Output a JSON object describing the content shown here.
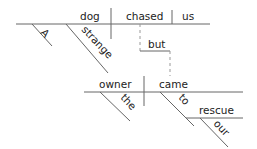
{
  "diagram": {
    "type": "sentence-diagram",
    "clause1": {
      "subject": "dog",
      "verb": "chased",
      "object": "us",
      "modifiers": [
        "A",
        "strange"
      ]
    },
    "conjunction": "but",
    "clause2": {
      "subject": "owner",
      "verb": "came",
      "subject_modifier": "the",
      "preposition": "to",
      "prep_object": "rescue",
      "prep_object_modifier": "our"
    }
  }
}
